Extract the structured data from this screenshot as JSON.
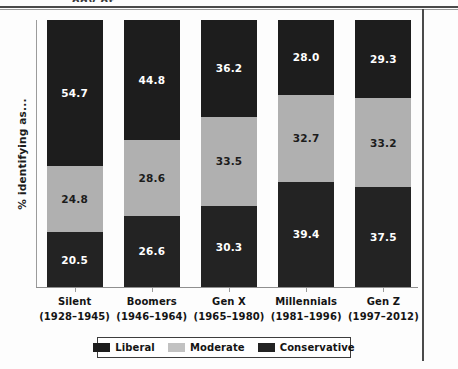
{
  "page": {
    "cropped_header_fragment": "ogy of..."
  },
  "chart_data": {
    "type": "bar",
    "subtype": "stacked-100-percent",
    "title": "",
    "xlabel": "",
    "ylabel": "% identifying as...",
    "ylim": [
      0,
      100
    ],
    "grid": false,
    "legend_position": "bottom",
    "categories": [
      "Silent\n(1928–1945)",
      "Boomers\n(1946–1964)",
      "Gen X\n(1965–1980)",
      "Millennials\n(1981–1996)",
      "Gen Z\n(1997–2012)"
    ],
    "category_names": [
      "Silent",
      "Boomers",
      "Gen X",
      "Millennials",
      "Gen Z"
    ],
    "category_years": [
      "(1928–1945)",
      "(1946–1964)",
      "(1965–1980)",
      "(1981–1996)",
      "(1997–2012)"
    ],
    "series": [
      {
        "name": "Liberal",
        "color": "#1d1d1d",
        "values": [
          54.7,
          44.8,
          36.2,
          28.0,
          29.3
        ]
      },
      {
        "name": "Moderate",
        "color": "#b0b0b0",
        "values": [
          24.8,
          28.6,
          33.5,
          32.7,
          33.2
        ]
      },
      {
        "name": "Conservative",
        "color": "#232323",
        "values": [
          20.5,
          26.6,
          30.3,
          39.4,
          37.5
        ]
      }
    ],
    "value_labels": {
      "Silent": {
        "Liberal": "54.7",
        "Moderate": "24.8",
        "Conservative": "20.5"
      },
      "Boomers": {
        "Liberal": "44.8",
        "Moderate": "28.6",
        "Conservative": "26.6"
      },
      "Gen X": {
        "Liberal": "36.2",
        "Moderate": "33.5",
        "Conservative": "30.3"
      },
      "Millennials": {
        "Liberal": "28.0",
        "Moderate": "32.7",
        "Conservative": "39.4"
      },
      "Gen Z": {
        "Liberal": "29.3",
        "Moderate": "33.2",
        "Conservative": "37.5"
      }
    },
    "legend": [
      {
        "label": "Liberal",
        "color": "#1d1d1d"
      },
      {
        "label": "Moderate",
        "color": "#c2c2c2"
      },
      {
        "label": "Conservative",
        "color": "#232323"
      }
    ]
  },
  "colors": {
    "liberal": "#1d1d1d",
    "moderate": "#b0b0b0",
    "conservative": "#232323",
    "axis": "#9b9b9b",
    "text": "#141414",
    "background": "#fdfdfd"
  }
}
